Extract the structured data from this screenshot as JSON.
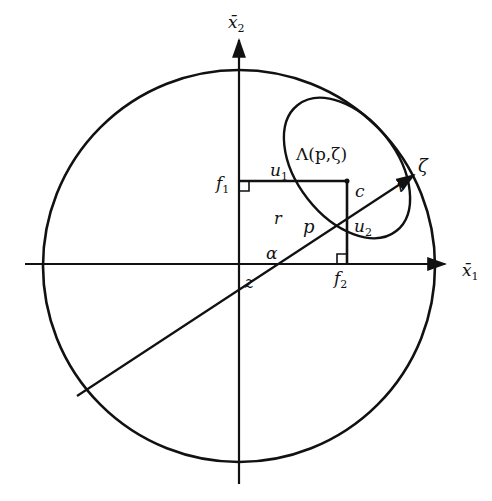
{
  "diagram": {
    "type": "geometric figure",
    "colors": {
      "ink": "#111111",
      "background": "#ffffff"
    },
    "axes": {
      "horizontal": {
        "label": "x̄",
        "subscript": "1"
      },
      "vertical": {
        "label": "x̄",
        "subscript": "2"
      }
    },
    "ray": {
      "label": "ζ"
    },
    "ellipse": {
      "label": "Λ(p,ζ)"
    },
    "points": {
      "origin": "z",
      "center": "c",
      "intersection_ray_ellipse_inner": "p",
      "intersection_ray_circle": "v"
    },
    "foot_labels": {
      "f1": {
        "label": "f",
        "subscript": "1"
      },
      "f2": {
        "label": "f",
        "subscript": "2"
      }
    },
    "segment_labels": {
      "u1": {
        "label": "u",
        "subscript": "1"
      },
      "u2": {
        "label": "u",
        "subscript": "2"
      },
      "r": "r"
    },
    "angle": {
      "label": "α"
    }
  }
}
